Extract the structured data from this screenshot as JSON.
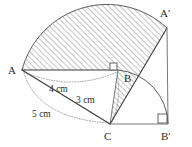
{
  "figure": {
    "vertices": [
      {
        "id": "A",
        "label": "A",
        "x": 22,
        "y": 70,
        "label_x": 8,
        "label_y": 74
      },
      {
        "id": "B",
        "label": "B",
        "x": 118,
        "y": 70,
        "label_x": 124,
        "label_y": 82
      },
      {
        "id": "C",
        "label": "C",
        "x": 110,
        "y": 124,
        "label_x": 104,
        "label_y": 139
      },
      {
        "id": "A2",
        "label": "A′",
        "x": 167,
        "y": 28,
        "label_x": 160,
        "label_y": 17
      },
      {
        "id": "B2",
        "label": "B′",
        "x": 168,
        "y": 124,
        "label_x": 162,
        "label_y": 139
      }
    ],
    "measures": [
      {
        "id": "ab",
        "label": "4 cm",
        "x": 49,
        "y": 92
      },
      {
        "id": "bc",
        "label": "3 cm",
        "x": 76,
        "y": 102
      },
      {
        "id": "ac",
        "label": "5 cm",
        "x": 32,
        "y": 116
      }
    ],
    "right_angles": [
      {
        "id": "angle-b",
        "x": 113,
        "y": 65,
        "size": 7
      },
      {
        "id": "angle-b2",
        "x": 157,
        "y": 113,
        "size": 8
      }
    ],
    "colors": {
      "stroke": "#3a3a3a",
      "thin_stroke": "#6a6a6a",
      "dotted": "#8d8d8d",
      "hatch": "#8a8a8a",
      "text": "#2b2b2b",
      "background": "#ffffff"
    },
    "segments": [
      {
        "id": "seg-ab",
        "from": "A",
        "to": "B"
      },
      {
        "id": "seg-ac",
        "from": "A",
        "to": "C"
      },
      {
        "id": "seg-bc",
        "from": "B",
        "to": "C"
      },
      {
        "id": "seg-ca2",
        "from": "C",
        "to": "A2"
      },
      {
        "id": "seg-a2b2",
        "from": "A2",
        "to": "B2"
      },
      {
        "id": "seg-cb2",
        "from": "C",
        "to": "B2"
      }
    ],
    "arcs": [
      {
        "id": "arc-aa2",
        "from": "A",
        "to": "A2",
        "center": "C",
        "radius": 5,
        "style": "solid"
      },
      {
        "id": "arc-bb2",
        "from": "B",
        "to": "B2",
        "center": "C",
        "radius": 3,
        "style": "solid"
      },
      {
        "id": "arc-4cm",
        "style": "dotted"
      },
      {
        "id": "arc-3cm",
        "style": "dotted"
      },
      {
        "id": "arc-5cm",
        "style": "dotted"
      }
    ],
    "shaded": {
      "id": "shaded-sector",
      "description": "hatched region between arc AA′ and triangle edges"
    }
  }
}
